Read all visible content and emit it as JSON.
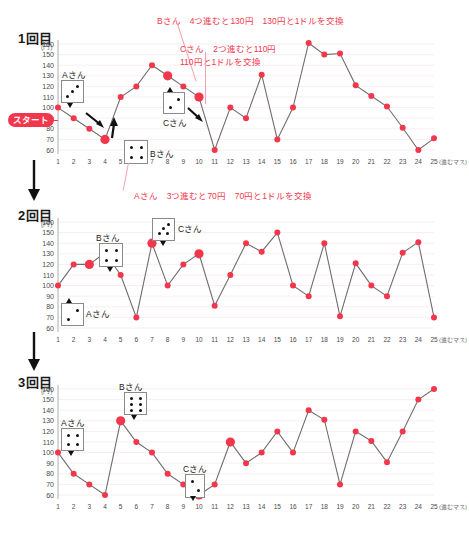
{
  "page": {
    "axis_unit_y": "(円)",
    "axis_unit_x": "(進むマス)",
    "start_label": "スタート",
    "accent_color": "#f2364c",
    "line_color": "#6e6e6e",
    "grid_color": "#f0dede"
  },
  "panels": [
    {
      "title": "1回目",
      "dice": [
        {
          "name": "Aさん",
          "pips": 3
        },
        {
          "name": "Bさん",
          "pips": 4
        },
        {
          "name": "Cさん",
          "pips": 2
        }
      ],
      "annotations": [
        "Bさん　4つ進むと130円　130円と1ドルを交換",
        "Cさん　2つ進むと110円",
        "110円と1ドルを交換",
        "Aさん　3つ進むと70円　70円と1ドルを交換"
      ]
    },
    {
      "title": "2回目",
      "dice": [
        {
          "name": "Aさん",
          "pips": 2
        },
        {
          "name": "Bさん",
          "pips": 4
        },
        {
          "name": "Cさん",
          "pips": 4
        }
      ],
      "annotations": []
    },
    {
      "title": "3回目",
      "dice": [
        {
          "name": "Aさん",
          "pips": 4
        },
        {
          "name": "Bさん",
          "pips": 6
        },
        {
          "name": "Cさん",
          "pips": 2
        }
      ],
      "annotations": []
    }
  ],
  "chart_data": [
    {
      "type": "line",
      "title": "1回目",
      "xlabel": "(進むマス)",
      "ylabel": "(円)",
      "ylim": [
        60,
        160
      ],
      "yticks": [
        60,
        70,
        80,
        90,
        100,
        110,
        120,
        130,
        140,
        150,
        160
      ],
      "x": [
        1,
        2,
        3,
        4,
        5,
        6,
        7,
        8,
        9,
        10,
        11,
        12,
        13,
        14,
        15,
        16,
        17,
        18,
        19,
        20,
        21,
        22,
        23,
        24,
        25
      ],
      "values": [
        100,
        90,
        80,
        70,
        110,
        120,
        140,
        130,
        120,
        110,
        60,
        100,
        90,
        131,
        70,
        100,
        161,
        150,
        151,
        121,
        111,
        101,
        81,
        60,
        71
      ],
      "highlighted_points": [
        4,
        8,
        10
      ],
      "grid": true,
      "legend": "none"
    },
    {
      "type": "line",
      "title": "2回目",
      "xlabel": "(進むマス)",
      "ylabel": "(円)",
      "ylim": [
        60,
        160
      ],
      "yticks": [
        60,
        70,
        80,
        90,
        100,
        110,
        120,
        130,
        140,
        150,
        160
      ],
      "x": [
        1,
        2,
        3,
        4,
        5,
        6,
        7,
        8,
        9,
        10,
        11,
        12,
        13,
        14,
        15,
        16,
        17,
        18,
        19,
        20,
        21,
        22,
        23,
        24,
        25
      ],
      "values": [
        100,
        120,
        120,
        131,
        110,
        70,
        140,
        100,
        120,
        130,
        81,
        110,
        140,
        132,
        150,
        100,
        90,
        140,
        71,
        121,
        100,
        90,
        131,
        141,
        70
      ],
      "highlighted_points": [
        3,
        7,
        10
      ],
      "grid": true,
      "legend": "none"
    },
    {
      "type": "line",
      "title": "3回目",
      "xlabel": "(進むマス)",
      "ylabel": "(円)",
      "ylim": [
        60,
        160
      ],
      "yticks": [
        60,
        70,
        80,
        90,
        100,
        110,
        120,
        130,
        140,
        150,
        160
      ],
      "x": [
        1,
        2,
        3,
        4,
        5,
        6,
        7,
        8,
        9,
        10,
        11,
        12,
        13,
        14,
        15,
        16,
        17,
        18,
        19,
        20,
        21,
        22,
        23,
        24,
        25
      ],
      "values": [
        100,
        80,
        70,
        60,
        130,
        110,
        100,
        80,
        70,
        60,
        70,
        110,
        90,
        100,
        120,
        100,
        140,
        131,
        70,
        120,
        111,
        91,
        120,
        150,
        160
      ],
      "highlighted_points": [
        5,
        10,
        12
      ],
      "grid": true,
      "legend": "none"
    }
  ]
}
